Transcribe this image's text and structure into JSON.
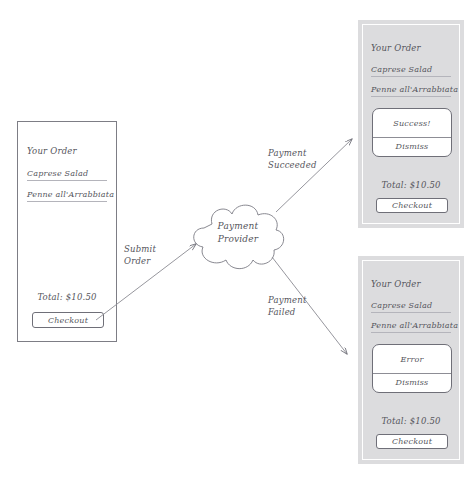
{
  "diagram": {
    "stroke_color": "#55555c",
    "panel_border_color": "#7d7d85",
    "scrim_color": "#dcdcde"
  },
  "order_panel": {
    "title": "Your Order",
    "items": [
      "Caprese Salad",
      "Penne all'Arrabbiata"
    ],
    "total": "Total: $10.50",
    "checkout_label": "Checkout"
  },
  "cloud": {
    "line1": "Payment",
    "line2": "Provider"
  },
  "arrows": [
    {
      "name": "submit-order",
      "line1": "Submit",
      "line2": "Order"
    },
    {
      "name": "payment-succeeded",
      "line1": "Payment",
      "line2": "Succeeded"
    },
    {
      "name": "payment-failed",
      "line1": "Payment",
      "line2": "Failed"
    }
  ],
  "success_panel": {
    "title": "Your Order",
    "items": [
      "Caprese Salad",
      "Penne all'Arrabbiata"
    ],
    "dialog_message": "Success!",
    "dialog_action": "Dismiss",
    "total": "Total: $10.50",
    "checkout_label": "Checkout"
  },
  "error_panel": {
    "title": "Your Order",
    "items": [
      "Caprese Salad",
      "Penne all'Arrabbiata"
    ],
    "dialog_message": "Error",
    "dialog_action": "Dismiss",
    "total": "Total: $10.50",
    "checkout_label": "Checkout"
  }
}
